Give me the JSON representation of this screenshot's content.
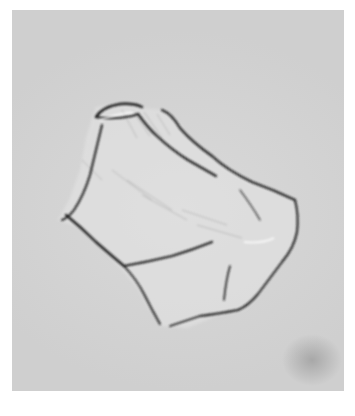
{
  "figure": {
    "colors": {
      "background": "#d4d4d4",
      "outline": "#1e1e1e",
      "page": "#ffffff"
    }
  },
  "caption": {
    "text": "",
    "note": "caption text cropped at bottom edge, illegible"
  }
}
